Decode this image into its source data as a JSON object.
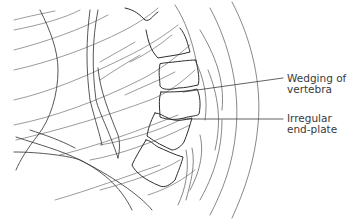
{
  "figure": {
    "colors": {
      "line": "#3a3a3a",
      "contour": "#7a7a7a",
      "background": "#ffffff"
    },
    "annotations": [
      {
        "id": "wedging",
        "line1": "Wedging of",
        "line2": "vertebra"
      },
      {
        "id": "endplate",
        "line1": "Irregular",
        "line2": "end-plate"
      }
    ]
  }
}
